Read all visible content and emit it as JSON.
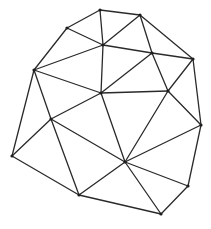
{
  "diagram": {
    "type": "triangulation-mesh",
    "stroke_color": "#2a2a2a",
    "vertex_color": "#1e1e1e",
    "vertices": {
      "A": [
        100,
        10
      ],
      "B": [
        67,
        28
      ],
      "C": [
        103,
        45
      ],
      "D": [
        34,
        70
      ],
      "E": [
        101,
        93
      ],
      "F": [
        140,
        15
      ],
      "G": [
        152,
        53
      ],
      "H": [
        193,
        59
      ],
      "I": [
        168,
        91
      ],
      "J": [
        51,
        119
      ],
      "K": [
        12,
        156
      ],
      "L": [
        79,
        195
      ],
      "M": [
        201,
        125
      ],
      "N": [
        125,
        162
      ],
      "O": [
        188,
        186
      ],
      "P": [
        161,
        214
      ]
    },
    "edges": [
      [
        "A",
        "B"
      ],
      [
        "A",
        "F"
      ],
      [
        "A",
        "C"
      ],
      [
        "F",
        "C"
      ],
      [
        "F",
        "G"
      ],
      [
        "F",
        "H"
      ],
      [
        "B",
        "C"
      ],
      [
        "B",
        "D"
      ],
      [
        "C",
        "D"
      ],
      [
        "C",
        "E"
      ],
      [
        "C",
        "G"
      ],
      [
        "G",
        "E"
      ],
      [
        "G",
        "H"
      ],
      [
        "G",
        "I"
      ],
      [
        "H",
        "I"
      ],
      [
        "H",
        "M"
      ],
      [
        "D",
        "E"
      ],
      [
        "D",
        "J"
      ],
      [
        "D",
        "K"
      ],
      [
        "E",
        "I"
      ],
      [
        "E",
        "J"
      ],
      [
        "E",
        "N"
      ],
      [
        "I",
        "M"
      ],
      [
        "I",
        "N"
      ],
      [
        "J",
        "K"
      ],
      [
        "J",
        "N"
      ],
      [
        "J",
        "L"
      ],
      [
        "K",
        "L"
      ],
      [
        "L",
        "N"
      ],
      [
        "L",
        "P"
      ],
      [
        "N",
        "P"
      ],
      [
        "N",
        "O"
      ],
      [
        "N",
        "M"
      ],
      [
        "M",
        "O"
      ],
      [
        "O",
        "P"
      ]
    ]
  }
}
